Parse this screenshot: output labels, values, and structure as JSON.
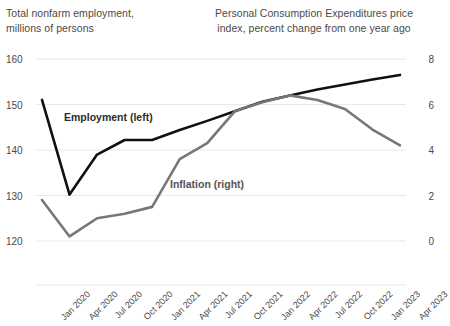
{
  "chart_data": {
    "type": "line",
    "title": "",
    "xlabel": "",
    "categories": [
      "Jan 2020",
      "Apr 2020",
      "Jul 2020",
      "Oct 2020",
      "Jan 2021",
      "Apr 2021",
      "Jul 2021",
      "Oct 2021",
      "Jan 2022",
      "Apr 2022",
      "Jul 2022",
      "Oct 2022",
      "Jan 2023",
      "Apr 2023"
    ],
    "grid": true,
    "legend_position": "inline-annotations",
    "axes": {
      "left": {
        "label": "Total nonfarm employment, millions of persons",
        "ticks": [
          "160",
          "150",
          "140",
          "130",
          "120"
        ],
        "tick_values": [
          160,
          150,
          140,
          130,
          120
        ],
        "ylim": [
          120,
          160
        ]
      },
      "right": {
        "label": "Personal Consumption Expenditures price index, percent change from one year ago",
        "ticks": [
          "8",
          "6",
          "4",
          "2",
          "0"
        ],
        "tick_values": [
          8,
          6,
          4,
          2,
          0
        ],
        "ylim": [
          0,
          8
        ]
      }
    },
    "series": [
      {
        "name": "Employment (left)",
        "axis": "left",
        "color": "#111111",
        "values": [
          151.0,
          130.2,
          139.0,
          142.2,
          142.2,
          144.4,
          146.4,
          148.5,
          150.6,
          152.0,
          153.3,
          154.4,
          155.5,
          156.5
        ]
      },
      {
        "name": "Inflation (right)",
        "axis": "right",
        "color": "#777777",
        "values": [
          1.8,
          0.2,
          1.0,
          1.2,
          1.5,
          3.6,
          4.3,
          5.7,
          6.1,
          6.4,
          6.2,
          5.8,
          4.9,
          4.2
        ]
      }
    ],
    "annotations": [
      {
        "text": "Employment (left)",
        "series": "Employment (left)"
      },
      {
        "text": "Inflation (right)",
        "series": "Inflation (right)"
      }
    ]
  },
  "titles": {
    "left_axis": "Total nonfarm employment,\nmillions of persons",
    "left_axis_line1": "Total nonfarm employment,",
    "left_axis_line2": "millions of persons",
    "right_axis_line1": "Personal Consumption Expenditures price",
    "right_axis_line2": "index, percent change from one year ago"
  },
  "colors": {
    "employment": "#111111",
    "inflation": "#777777",
    "grid": "#e8e8e8",
    "text": "#4a4a4a",
    "background": "#ffffff"
  }
}
